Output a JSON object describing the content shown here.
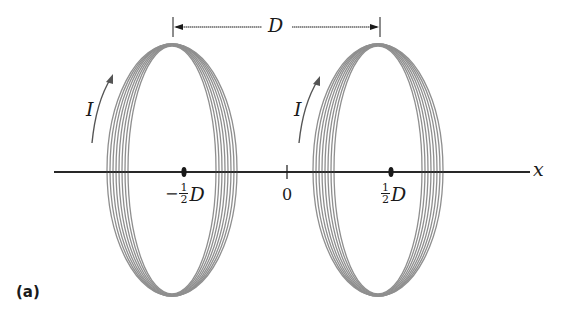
{
  "figure": {
    "panel_label": "(a)",
    "separation_label": "D",
    "current_label_left": "I",
    "current_label_right": "I",
    "axis_label": "x",
    "ticks": {
      "left": {
        "sign": "−",
        "num": "1",
        "den": "2",
        "var": "D"
      },
      "origin": "0",
      "right": {
        "sign": "",
        "num": "1",
        "den": "2",
        "var": "D"
      }
    },
    "colors": {
      "coil": "#8a8a8a",
      "coil_dark": "#6f6f6f",
      "axis": "#1a1a1a",
      "arrow": "#555555"
    },
    "coils": [
      {
        "name": "left-coil",
        "center_x": 172,
        "center_y": 170,
        "rx": 54,
        "ry": 126,
        "turns": 7
      },
      {
        "name": "right-coil",
        "center_x": 378,
        "center_y": 170,
        "rx": 54,
        "ry": 126,
        "turns": 7
      }
    ]
  }
}
